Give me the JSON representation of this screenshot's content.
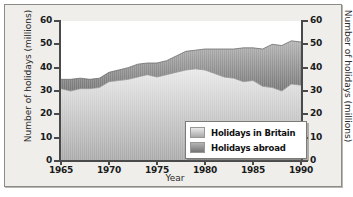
{
  "chart_data": {
    "type": "area",
    "title": "",
    "xlabel": "Year",
    "ylabel": "Number of holidays (millions)",
    "ylabel_right": "Number of holidays (millions)",
    "xlim": [
      1965,
      1990
    ],
    "ylim": [
      0,
      60
    ],
    "yticks": [
      0,
      10,
      20,
      30,
      40,
      50,
      60
    ],
    "xticks": [
      1965,
      1970,
      1975,
      1980,
      1985,
      1990
    ],
    "grid": false,
    "stacked": true,
    "legend_position": "inside-bottom-right",
    "x": [
      1965,
      1966,
      1967,
      1968,
      1969,
      1970,
      1971,
      1972,
      1973,
      1974,
      1975,
      1976,
      1977,
      1978,
      1979,
      1980,
      1981,
      1982,
      1983,
      1984,
      1985,
      1986,
      1987,
      1988,
      1989,
      1990
    ],
    "series": [
      {
        "name": "Holidays in Britain",
        "color": "#d8d8d8",
        "values": [
          31,
          30,
          31,
          31,
          31.5,
          34,
          34.5,
          35,
          36,
          37,
          36,
          37,
          38,
          39,
          39.5,
          39,
          37.5,
          36,
          35.5,
          34,
          34.5,
          32,
          31.5,
          30,
          33,
          32.5
        ]
      },
      {
        "name": "Holidays abroad",
        "color": "#9a9a9a",
        "values": [
          4,
          5,
          4.5,
          4,
          4,
          4,
          4.5,
          5,
          5.5,
          5,
          6,
          6,
          7,
          8,
          8,
          9,
          10.5,
          12,
          12.5,
          14.5,
          14,
          16,
          18.5,
          19.5,
          18.5,
          18.5
        ]
      }
    ],
    "totals": [
      35,
      35,
      35.5,
      35,
      35.5,
      38,
      39,
      40,
      41.5,
      42,
      42,
      43,
      45,
      47,
      47.5,
      48,
      48,
      48,
      48,
      48.5,
      48.5,
      48,
      50,
      49.5,
      51.5,
      51
    ]
  },
  "legend": {
    "items": [
      {
        "label": "Holidays in Britain"
      },
      {
        "label": "Holidays abroad"
      }
    ]
  },
  "colors": {
    "frame_bg": "#efeeea",
    "plot_bg": "#ffffff",
    "axis": "#4a4a4a",
    "britain_light": "#e6e6e6",
    "britain_dark": "#b5b5b5",
    "abroad_light": "#b0b0b0",
    "abroad_dark": "#7e7e7e"
  }
}
